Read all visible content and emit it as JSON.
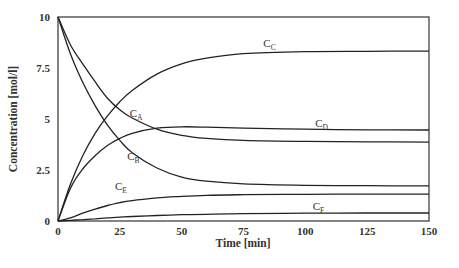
{
  "chart_data": {
    "type": "line",
    "title": "",
    "xlabel": "Time [min]",
    "ylabel": "Concentration [mol/l]",
    "xlim": [
      0,
      150
    ],
    "ylim": [
      0,
      10
    ],
    "x_ticks": [
      "0",
      "25",
      "50",
      "75",
      "100",
      "125",
      "150"
    ],
    "y_ticks": [
      "0",
      "2.5",
      "5",
      "7.5",
      "10"
    ],
    "grid": false,
    "legend": "inline labels",
    "x": [
      0,
      5,
      10,
      15,
      20,
      25,
      30,
      40,
      50,
      60,
      75,
      100,
      125,
      150
    ],
    "series": [
      {
        "name": "C_A",
        "label_main": "C",
        "label_sub": "A",
        "values": [
          10.0,
          8.64,
          7.7,
          6.83,
          6.02,
          5.45,
          5.05,
          4.5,
          4.2,
          4.05,
          3.95,
          3.9,
          3.88,
          3.87
        ],
        "label_pos": [
          29,
          5.1
        ]
      },
      {
        "name": "C_B",
        "label_main": "C",
        "label_sub": "B",
        "values": [
          10.0,
          8.2,
          6.8,
          5.65,
          4.7,
          3.95,
          3.35,
          2.6,
          2.15,
          1.95,
          1.82,
          1.75,
          1.73,
          1.72
        ],
        "label_pos": [
          28,
          3.0
        ]
      },
      {
        "name": "C_C",
        "label_main": "C",
        "label_sub": "C",
        "values": [
          0.0,
          1.8,
          3.2,
          4.3,
          5.15,
          5.85,
          6.4,
          7.2,
          7.7,
          7.98,
          8.2,
          8.3,
          8.32,
          8.33
        ],
        "label_pos": [
          83,
          8.55
        ]
      },
      {
        "name": "C_D",
        "label_main": "C",
        "label_sub": "D",
        "values": [
          0.0,
          1.6,
          2.55,
          3.2,
          3.7,
          4.05,
          4.3,
          4.55,
          4.62,
          4.6,
          4.55,
          4.5,
          4.47,
          4.46
        ],
        "label_pos": [
          104,
          4.6
        ]
      },
      {
        "name": "C_E",
        "label_main": "C",
        "label_sub": "E",
        "values": [
          0.0,
          0.15,
          0.38,
          0.58,
          0.76,
          0.9,
          1.0,
          1.13,
          1.21,
          1.26,
          1.29,
          1.31,
          1.32,
          1.32
        ],
        "label_pos": [
          23,
          1.5
        ]
      },
      {
        "name": "C_F",
        "label_main": "C",
        "label_sub": "F",
        "values": [
          0.0,
          0.03,
          0.07,
          0.11,
          0.15,
          0.19,
          0.22,
          0.27,
          0.31,
          0.33,
          0.36,
          0.38,
          0.39,
          0.39
        ],
        "label_pos": [
          103,
          0.55
        ]
      }
    ]
  }
}
